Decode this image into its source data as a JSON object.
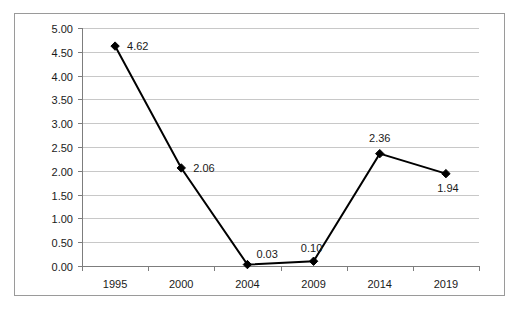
{
  "chart_data": {
    "type": "line",
    "title": "",
    "subtitle": "",
    "xlabel": "",
    "ylabel": "",
    "categories": [
      "1995",
      "2000",
      "2004",
      "2009",
      "2014",
      "2019"
    ],
    "values": [
      4.62,
      2.06,
      0.03,
      0.1,
      2.36,
      1.94
    ],
    "data_labels": [
      "4.62",
      "2.06",
      "0.03",
      "0.10",
      "2.36",
      "1.94"
    ],
    "ylim": [
      0.0,
      5.0
    ],
    "ytick_values": [
      5.0,
      4.5,
      4.0,
      3.5,
      3.0,
      2.5,
      2.0,
      1.5,
      1.0,
      0.5,
      0.0
    ],
    "ytick_labels": [
      "5.00",
      "4.50",
      "4.00",
      "3.50",
      "3.00",
      "2.50",
      "2.00",
      "1.50",
      "1.00",
      "0.50",
      "0.00"
    ],
    "grid": true,
    "grid_axis": "y",
    "legend": false,
    "legend_position": "none",
    "marker": "diamond",
    "line_color": "#000000",
    "grid_color": "#c8c8c8",
    "axis_color": "#7d7d7d",
    "border_color": "#9a9a9a",
    "background_color": "#ffffff"
  }
}
